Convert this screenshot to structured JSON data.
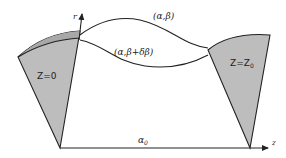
{
  "diagram": {
    "axes": {
      "r_label": "r",
      "z_label": "z"
    },
    "left_surface": {
      "label": "Z=0"
    },
    "right_surface": {
      "label_main": "Z=Z",
      "label_sub": "0"
    },
    "curves": {
      "upper_label": "(α,β)",
      "lower_label": "(α,β+δβ)"
    },
    "axis_path": {
      "label_main": "α",
      "label_sub": "0"
    },
    "colors": {
      "fill": "#bdbdbd",
      "fill_dark": "#a8a8a8",
      "stroke": "#222222"
    }
  }
}
